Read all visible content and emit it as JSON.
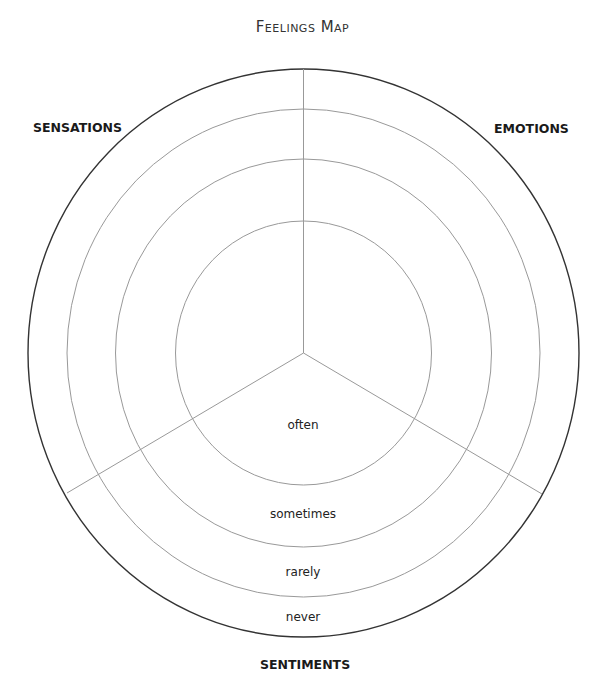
{
  "title": "Feelings Map",
  "sections": {
    "top_left": "SENSATIONS",
    "top_right": "EMOTIONS",
    "bottom": "SENTIMENTS"
  },
  "rings": [
    {
      "label": "often"
    },
    {
      "label": "sometimes"
    },
    {
      "label": "rarely"
    },
    {
      "label": "never"
    }
  ],
  "colors": {
    "outer_stroke": "#333333",
    "inner_stroke": "#999999",
    "text": "#222222"
  }
}
